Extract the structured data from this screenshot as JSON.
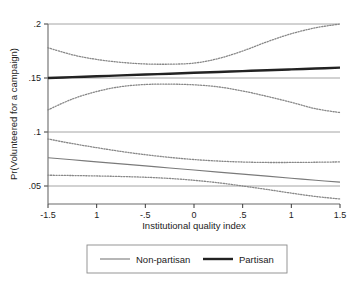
{
  "chart_data": {
    "type": "line",
    "title": "",
    "subtitle": "",
    "xlabel": "Institutional quality index",
    "ylabel": "Pr(Volunteered for a campaign)",
    "xlim": [
      -1.5,
      1.5
    ],
    "ylim": [
      0.036,
      0.2
    ],
    "xticks": [
      -1.5,
      -1,
      -0.5,
      0,
      0.5,
      1,
      1.5
    ],
    "xticklabels": [
      "-1.5",
      "1",
      "-.5",
      "0",
      ".5",
      "1",
      "1.5"
    ],
    "yticks": [
      0.05,
      0.1,
      0.15,
      0.2
    ],
    "yticklabels": [
      ".05",
      ".1",
      ".15",
      ".2"
    ],
    "grid": "horizontal",
    "legend_position": "below",
    "x": [
      -1.5,
      -1.25,
      -1.0,
      -0.75,
      -0.5,
      -0.25,
      0,
      0.25,
      0.5,
      0.75,
      1.0,
      1.25,
      1.5
    ],
    "series": [
      {
        "name": "Partisan",
        "style": "solid-thick",
        "color": "#222222",
        "values": [
          0.15,
          0.1508,
          0.1516,
          0.1524,
          0.1532,
          0.154,
          0.1548,
          0.1556,
          0.1564,
          0.1572,
          0.158,
          0.1588,
          0.1596
        ]
      },
      {
        "name": "Partisan CI upper",
        "style": "dotted",
        "color": "#888888",
        "values": [
          0.178,
          0.1715,
          0.1672,
          0.1645,
          0.163,
          0.1628,
          0.1638,
          0.168,
          0.175,
          0.1835,
          0.191,
          0.1965,
          0.2
        ]
      },
      {
        "name": "Partisan CI lower",
        "style": "dotted",
        "color": "#888888",
        "values": [
          0.1205,
          0.1305,
          0.1375,
          0.142,
          0.144,
          0.1443,
          0.1437,
          0.1418,
          0.138,
          0.133,
          0.1275,
          0.1215,
          0.118
        ]
      },
      {
        "name": "Non-partisan",
        "style": "solid-thin",
        "color": "#7a7a7a",
        "values": [
          0.0762,
          0.0743,
          0.0724,
          0.0705,
          0.0686,
          0.0667,
          0.0648,
          0.0629,
          0.061,
          0.0591,
          0.0572,
          0.0553,
          0.0536
        ]
      },
      {
        "name": "Non-partisan CI upper",
        "style": "dotted",
        "color": "#888888",
        "values": [
          0.0935,
          0.0893,
          0.0855,
          0.082,
          0.079,
          0.0765,
          0.0745,
          0.0731,
          0.0722,
          0.0718,
          0.0718,
          0.072,
          0.0723
        ]
      },
      {
        "name": "Non-partisan CI lower",
        "style": "dotted",
        "color": "#888888",
        "values": [
          0.06,
          0.0597,
          0.0593,
          0.0588,
          0.0581,
          0.057,
          0.0553,
          0.053,
          0.05,
          0.0468,
          0.0434,
          0.0403,
          0.038
        ]
      }
    ],
    "legend": [
      {
        "label": "Non-partisan",
        "style": "solid-thin",
        "color": "#7a7a7a"
      },
      {
        "label": "Partisan",
        "style": "solid-thick",
        "color": "#222222"
      }
    ]
  }
}
